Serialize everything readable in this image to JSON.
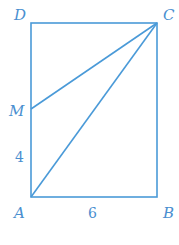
{
  "diagram": {
    "type": "geometry",
    "shape": "rectangle ABCD with segments MC and AC",
    "stroke_color": "#4a9ad8",
    "points": {
      "A": {
        "label": "A"
      },
      "B": {
        "label": "B"
      },
      "C": {
        "label": "C"
      },
      "D": {
        "label": "D"
      },
      "M": {
        "label": "M"
      }
    },
    "lengths": {
      "AM": "4",
      "AB": "6"
    }
  }
}
